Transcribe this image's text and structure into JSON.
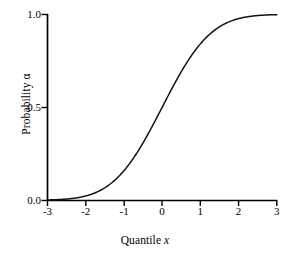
{
  "figure": {
    "background": "#ffffff",
    "line_color": "#111111",
    "axis_color": "#000000"
  },
  "axes": {
    "x": {
      "label_prefix": "Quantile ",
      "label_var": "x",
      "ticks": [
        "-3",
        "-2",
        "-1",
        "0",
        "1",
        "2",
        "3"
      ],
      "tick_values": [
        -3,
        -2,
        -1,
        0,
        1,
        2,
        3
      ],
      "range": [
        -3,
        3
      ]
    },
    "y": {
      "label_prefix": "Probability ",
      "label_var": "α",
      "ticks": [
        "0.0",
        "0.5",
        "1.0"
      ],
      "tick_values": [
        0.0,
        0.5,
        1.0
      ],
      "range": [
        0.0,
        1.0
      ]
    }
  },
  "chart_data": {
    "type": "line",
    "title": "",
    "xlabel": "Quantile x",
    "ylabel": "Probability α",
    "xlim": [
      -3,
      3
    ],
    "ylim": [
      0.0,
      1.0
    ],
    "xticks": [
      -3,
      -2,
      -1,
      0,
      1,
      2,
      3
    ],
    "yticks": [
      0.0,
      0.5,
      1.0
    ],
    "grid": false,
    "legend": "none",
    "series": [
      {
        "name": "Standard normal cumulative distribution function",
        "x": [
          -3.0,
          -2.8,
          -2.6,
          -2.4,
          -2.2,
          -2.0,
          -1.8,
          -1.6,
          -1.4,
          -1.2,
          -1.0,
          -0.8,
          -0.6,
          -0.4,
          -0.2,
          0.0,
          0.2,
          0.4,
          0.6,
          0.8,
          1.0,
          1.2,
          1.4,
          1.6,
          1.8,
          2.0,
          2.2,
          2.4,
          2.6,
          2.8,
          3.0
        ],
        "y": [
          0.0013,
          0.0026,
          0.0047,
          0.0082,
          0.0139,
          0.0228,
          0.0359,
          0.0548,
          0.0808,
          0.1151,
          0.1587,
          0.2119,
          0.2743,
          0.3446,
          0.4207,
          0.5,
          0.5793,
          0.6554,
          0.7257,
          0.7881,
          0.8413,
          0.8849,
          0.9192,
          0.9452,
          0.9641,
          0.9772,
          0.9861,
          0.9918,
          0.9953,
          0.9974,
          0.9987
        ]
      }
    ]
  }
}
